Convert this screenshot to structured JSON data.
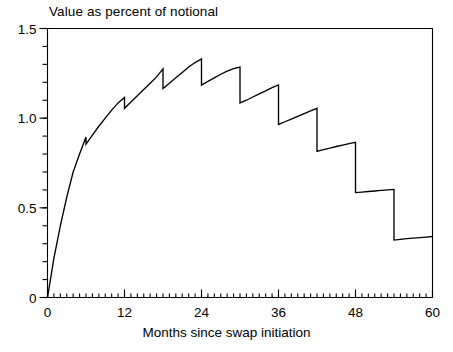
{
  "chart_data": {
    "type": "line",
    "title": "Value as percent of notional",
    "xlabel": "Months since swap initiation",
    "ylabel": "",
    "xlim": [
      0,
      60
    ],
    "ylim": [
      0,
      1.5
    ],
    "grid": false,
    "legend": "none",
    "x_ticks": [
      {
        "value": 0,
        "label": "0"
      },
      {
        "value": 12,
        "label": "12"
      },
      {
        "value": 24,
        "label": "24"
      },
      {
        "value": 36,
        "label": "36"
      },
      {
        "value": 48,
        "label": "48"
      },
      {
        "value": 60,
        "label": "60"
      }
    ],
    "x_minor_tick_interval": 1,
    "y_ticks": [
      {
        "value": 0,
        "label": "0"
      },
      {
        "value": 0.5,
        "label": "0.5"
      },
      {
        "value": 1.0,
        "label": "1.0"
      },
      {
        "value": 1.5,
        "label": "1.5"
      }
    ],
    "y_minor_tick_interval": 0.1,
    "series": [
      {
        "name": "swap value",
        "color": "#000000",
        "description": "Sawtooth: value accrues between semiannual payment dates then drops at each payment (every 6 months).",
        "points": [
          [
            0,
            0.0
          ],
          [
            1,
            0.22
          ],
          [
            2,
            0.4
          ],
          [
            3,
            0.56
          ],
          [
            4,
            0.7
          ],
          [
            5,
            0.8
          ],
          [
            6,
            0.895
          ],
          [
            6,
            0.855
          ],
          [
            7,
            0.905
          ],
          [
            8,
            0.955
          ],
          [
            9,
            1.0
          ],
          [
            10,
            1.045
          ],
          [
            11,
            1.085
          ],
          [
            12,
            1.115
          ],
          [
            12,
            1.055
          ],
          [
            13,
            1.09
          ],
          [
            14,
            1.125
          ],
          [
            15,
            1.16
          ],
          [
            16,
            1.195
          ],
          [
            17,
            1.23
          ],
          [
            18,
            1.275
          ],
          [
            18,
            1.165
          ],
          [
            19,
            1.195
          ],
          [
            20,
            1.225
          ],
          [
            21,
            1.255
          ],
          [
            22,
            1.285
          ],
          [
            23,
            1.31
          ],
          [
            24,
            1.33
          ],
          [
            24,
            1.185
          ],
          [
            25,
            1.205
          ],
          [
            26,
            1.225
          ],
          [
            27,
            1.245
          ],
          [
            28,
            1.262
          ],
          [
            29,
            1.276
          ],
          [
            30,
            1.285
          ],
          [
            30,
            1.085
          ],
          [
            31,
            1.1
          ],
          [
            32,
            1.118
          ],
          [
            33,
            1.135
          ],
          [
            34,
            1.152
          ],
          [
            35,
            1.17
          ],
          [
            36,
            1.185
          ],
          [
            36,
            0.965
          ],
          [
            37,
            0.98
          ],
          [
            38,
            0.995
          ],
          [
            39,
            1.01
          ],
          [
            40,
            1.025
          ],
          [
            41,
            1.04
          ],
          [
            42,
            1.055
          ],
          [
            42,
            0.815
          ],
          [
            43,
            0.825
          ],
          [
            44,
            0.833
          ],
          [
            45,
            0.842
          ],
          [
            46,
            0.85
          ],
          [
            47,
            0.858
          ],
          [
            48,
            0.865
          ],
          [
            48,
            0.585
          ],
          [
            49,
            0.588
          ],
          [
            50,
            0.591
          ],
          [
            51,
            0.594
          ],
          [
            52,
            0.597
          ],
          [
            53,
            0.6
          ],
          [
            54,
            0.603
          ],
          [
            54,
            0.32
          ],
          [
            55,
            0.324
          ],
          [
            56,
            0.328
          ],
          [
            57,
            0.331
          ],
          [
            58,
            0.334
          ],
          [
            59,
            0.337
          ],
          [
            60,
            0.34
          ]
        ]
      }
    ]
  }
}
